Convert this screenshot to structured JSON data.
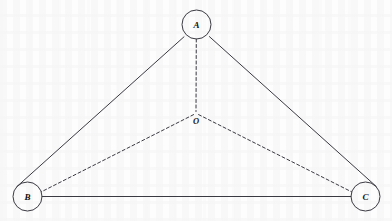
{
  "figure": {
    "canvas": {
      "width": 392,
      "height": 221
    },
    "background_color": "#fdfdfd",
    "ink_color": "#3a3a42",
    "label_color": "#111111",
    "stroke_width": 1,
    "dash_pattern": "3,2.5"
  },
  "nodes": [
    {
      "id": "A",
      "label": "A",
      "cx": 196.5,
      "cy": 24.5,
      "r": 14.5,
      "shape": "circle",
      "name": "node-a"
    },
    {
      "id": "B",
      "label": "B",
      "cx": 27.5,
      "cy": 196.5,
      "r": 14.5,
      "shape": "circle",
      "name": "node-b"
    },
    {
      "id": "C",
      "label": "C",
      "cx": 365.5,
      "cy": 196.5,
      "r": 14.5,
      "shape": "circle",
      "name": "node-c"
    }
  ],
  "interior_point": {
    "id": "O",
    "label": "O",
    "x": 196,
    "y": 113,
    "label_x": 196,
    "label_y": 124,
    "shape": "none"
  },
  "edges": [
    {
      "id": "AB",
      "from": "A",
      "to": "B",
      "style": "solid",
      "x1": 184.0,
      "y1": 36.8,
      "x2": 16.9,
      "y2": 186.6,
      "name": "edge-a-b"
    },
    {
      "id": "AC",
      "from": "A",
      "to": "C",
      "style": "solid",
      "x1": 209.4,
      "y1": 36.6,
      "x2": 376.2,
      "y2": 186.4,
      "name": "edge-a-c"
    },
    {
      "id": "BC",
      "from": "B",
      "to": "C",
      "style": "solid",
      "x1": 42.0,
      "y1": 196.5,
      "x2": 351.0,
      "y2": 196.5,
      "name": "edge-b-c"
    },
    {
      "id": "AO",
      "from": "A",
      "to": "O",
      "style": "dashed",
      "x1": 196.3,
      "y1": 39.0,
      "x2": 196.0,
      "y2": 111.5,
      "name": "edge-a-o"
    },
    {
      "id": "OB",
      "from": "O",
      "to": "B",
      "style": "dashed",
      "x1": 193.6,
      "y1": 114.6,
      "x2": 41.4,
      "y2": 191.8,
      "name": "edge-o-b"
    },
    {
      "id": "OC",
      "from": "O",
      "to": "C",
      "style": "dashed",
      "x1": 198.6,
      "y1": 114.6,
      "x2": 351.5,
      "y2": 191.8,
      "name": "edge-o-c"
    }
  ]
}
